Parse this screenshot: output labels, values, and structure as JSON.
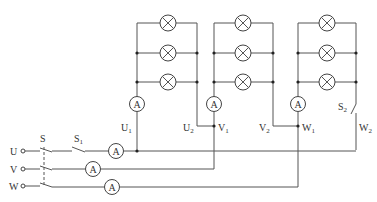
{
  "diagram": {
    "type": "three-phase lamp load circuit (delta connection)",
    "colors": {
      "wire": "#555555",
      "background": "#ffffff",
      "text": "#333333"
    },
    "supply_terminals": [
      {
        "label": "U",
        "y": 151
      },
      {
        "label": "V",
        "y": 169
      },
      {
        "label": "W",
        "y": 186
      }
    ],
    "switches": {
      "main": {
        "label": "S",
        "type": "three-pole ganged switch"
      },
      "s1": {
        "label": "S",
        "sub": "1"
      },
      "s2": {
        "label": "S",
        "sub": "2"
      }
    },
    "line_ammeters": [
      {
        "phase": "U",
        "label": "A",
        "cx": 116,
        "cy": 151
      },
      {
        "phase": "V",
        "label": "A",
        "cx": 93,
        "cy": 169
      },
      {
        "phase": "W",
        "label": "A",
        "cx": 112,
        "cy": 187
      }
    ],
    "lamp_groups": [
      {
        "name": "U-phase load",
        "ammeter": "A",
        "lamps": 3,
        "start": {
          "l": "U",
          "s": "1"
        },
        "end": {
          "l": "U",
          "s": "2"
        }
      },
      {
        "name": "V-phase load",
        "ammeter": "A",
        "lamps": 3,
        "start": {
          "l": "V",
          "s": "1"
        },
        "end": {
          "l": "V",
          "s": "2"
        }
      },
      {
        "name": "W-phase load",
        "ammeter": "A",
        "lamps": 3,
        "start": {
          "l": "W",
          "s": "1"
        },
        "end": {
          "l": "W",
          "s": "2"
        }
      }
    ],
    "icons": {
      "lamp": "lamp-icon (circle with X)",
      "ammeter": "ammeter-icon (circle with A)",
      "terminal": "terminal-icon (open circle)"
    }
  }
}
